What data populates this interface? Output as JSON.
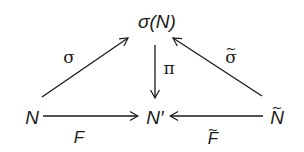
{
  "diagram": {
    "type": "commutative-diagram",
    "nodes": {
      "top": "σ(N)",
      "left": "N",
      "center": "N′",
      "right_base": "N",
      "right_tilde": "~"
    },
    "arrows": {
      "left_diag": {
        "label": "σ",
        "from": "N",
        "to": "σ(N)"
      },
      "right_diag": {
        "label_base": "σ",
        "label_tilde": "~",
        "from": "Ñ",
        "to": "σ(N)"
      },
      "vertical": {
        "label": "π",
        "from": "σ(N)",
        "to": "N′"
      },
      "bottom_left": {
        "label": "F",
        "from": "N",
        "to": "N′"
      },
      "bottom_right": {
        "label_base": "F",
        "label_tilde": "~",
        "from": "Ñ",
        "to": "N′"
      }
    },
    "colors": {
      "ink": "#1a1a1a",
      "background": "#ffffff"
    }
  }
}
